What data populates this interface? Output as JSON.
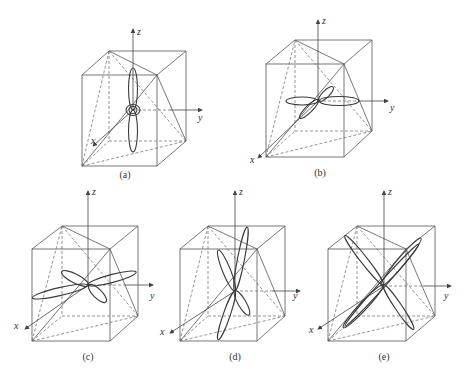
{
  "figure": {
    "panels": [
      {
        "id": "a",
        "caption": "(a)",
        "axis_labels": {
          "x": "x",
          "y": "y",
          "z": "z"
        },
        "description": "vertical two-lobe pattern along z with small ring at origin"
      },
      {
        "id": "b",
        "caption": "(b)",
        "axis_labels": {
          "x": "x",
          "y": "y",
          "z": "z"
        },
        "description": "four-lobe pattern in x-y plane"
      },
      {
        "id": "c",
        "caption": "(c)",
        "axis_labels": {
          "x": "x",
          "y": "y",
          "z": "z"
        },
        "description": "four-lobe pattern with elongated lobes tilted"
      },
      {
        "id": "d",
        "caption": "(d)",
        "axis_labels": {
          "x": "x",
          "y": "y",
          "z": "z"
        },
        "description": "four-lobe pattern in a near-vertical plane"
      },
      {
        "id": "e",
        "caption": "(e)",
        "axis_labels": {
          "x": "x",
          "y": "y",
          "z": "z"
        },
        "description": "crossed narrow lobes along body diagonals"
      }
    ]
  }
}
